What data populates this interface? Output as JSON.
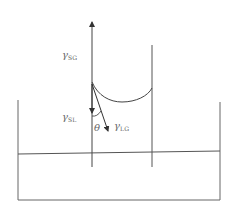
{
  "diagram": {
    "title": "",
    "labels": {
      "gamma_sg": {
        "symbol": "γ",
        "sub": "SG"
      },
      "gamma_sl": {
        "symbol": "γ",
        "sub": "SL"
      },
      "gamma_lg": {
        "symbol": "γ",
        "sub": "LG"
      },
      "theta": "θ"
    },
    "colors": {
      "line": "#555555",
      "text": "#666666",
      "background": "#ffffff"
    }
  }
}
